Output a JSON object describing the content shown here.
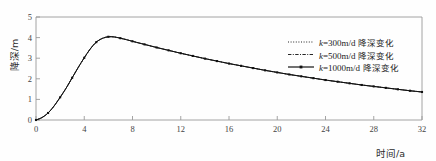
{
  "chart_data": {
    "type": "line",
    "title": "",
    "xlabel": "时间/a",
    "ylabel": "降深/m",
    "xlim": [
      0,
      32
    ],
    "ylim": [
      0,
      5
    ],
    "grid": false,
    "legend_position": "upper-right",
    "xticks": [
      0,
      4,
      8,
      12,
      16,
      20,
      24,
      28,
      32
    ],
    "xticklabels": [
      "0",
      "4",
      "8",
      "12",
      "16",
      "20",
      "24",
      "28",
      "32"
    ],
    "yticks": [
      0,
      1,
      2,
      3,
      4,
      5
    ],
    "yticklabels": [
      "0",
      "1",
      "2",
      "3",
      "4",
      "5"
    ],
    "x": [
      0,
      0.5,
      1,
      1.5,
      2,
      2.5,
      3,
      3.5,
      4,
      4.5,
      5,
      5.5,
      6,
      6.5,
      7,
      7.5,
      8,
      9,
      10,
      11,
      12,
      13,
      14,
      15,
      16,
      17,
      18,
      19,
      20,
      21,
      22,
      23,
      24,
      25,
      26,
      27,
      28,
      29,
      30,
      31,
      32
    ],
    "series": [
      {
        "name": "k=300m/d 降深变化",
        "k_value": 300,
        "k_unit": "m/d",
        "description": "降深变化",
        "linestyle": "dotted",
        "marker": "none",
        "color": "#1a1a1a",
        "values": [
          0,
          0.12,
          0.34,
          0.68,
          1.1,
          1.55,
          2.05,
          2.55,
          3.02,
          3.45,
          3.78,
          3.96,
          4.04,
          4.03,
          3.97,
          3.9,
          3.82,
          3.67,
          3.52,
          3.38,
          3.24,
          3.11,
          2.98,
          2.86,
          2.74,
          2.63,
          2.52,
          2.41,
          2.31,
          2.21,
          2.12,
          2.03,
          1.94,
          1.86,
          1.78,
          1.7,
          1.63,
          1.56,
          1.49,
          1.42,
          1.36
        ]
      },
      {
        "name": "k=500m/d 降深变化",
        "k_value": 500,
        "k_unit": "m/d",
        "description": "降深变化",
        "linestyle": "dashdot",
        "marker": "none",
        "color": "#1a1a1a",
        "values": [
          0,
          0.12,
          0.34,
          0.68,
          1.1,
          1.55,
          2.05,
          2.55,
          3.02,
          3.45,
          3.78,
          3.96,
          4.04,
          4.03,
          3.97,
          3.9,
          3.82,
          3.67,
          3.52,
          3.38,
          3.24,
          3.11,
          2.98,
          2.86,
          2.74,
          2.63,
          2.52,
          2.41,
          2.31,
          2.21,
          2.12,
          2.03,
          1.94,
          1.86,
          1.78,
          1.7,
          1.63,
          1.56,
          1.49,
          1.42,
          1.36
        ]
      },
      {
        "name": "k=1000m/d 降深变化",
        "k_value": 1000,
        "k_unit": "m/d",
        "description": "降深变化",
        "linestyle": "solid",
        "marker": "square",
        "color": "#111111",
        "values": [
          0,
          0.12,
          0.34,
          0.68,
          1.1,
          1.55,
          2.05,
          2.55,
          3.02,
          3.45,
          3.78,
          3.96,
          4.04,
          4.03,
          3.97,
          3.9,
          3.82,
          3.67,
          3.52,
          3.38,
          3.24,
          3.11,
          2.98,
          2.86,
          2.74,
          2.63,
          2.52,
          2.41,
          2.31,
          2.21,
          2.12,
          2.03,
          1.94,
          1.86,
          1.78,
          1.7,
          1.63,
          1.56,
          1.49,
          1.42,
          1.36
        ]
      }
    ],
    "peak": {
      "x": 6,
      "y": 4.04
    }
  },
  "legend": {
    "entries": [
      {
        "sample": "dotted",
        "prefix": "k",
        "equals": "=",
        "value": "300m/d",
        "text": "降深变化"
      },
      {
        "sample": "dashdot",
        "prefix": "k",
        "equals": "=",
        "value": "500m/d",
        "text": "降深变化"
      },
      {
        "sample": "solid-marker",
        "prefix": "k",
        "equals": "=",
        "value": "1000m/d",
        "text": "降深变化"
      }
    ]
  },
  "axes": {
    "y_title": "降深/m",
    "x_title": "时间/a"
  },
  "colors": {
    "frame": "#9a9a9a",
    "curve": "#141414",
    "text": "#2b2b2b"
  }
}
